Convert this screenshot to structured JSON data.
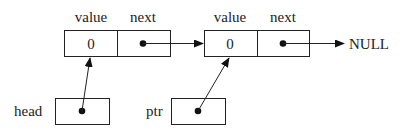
{
  "diagram": {
    "type": "linked-list",
    "header_labels": {
      "value": "value",
      "next": "next"
    },
    "nodes": [
      {
        "value": "0",
        "value_label": "value",
        "next_label": "next"
      },
      {
        "value": "0",
        "value_label": "value",
        "next_label": "next"
      }
    ],
    "terminal": "NULL",
    "pointers": [
      {
        "name": "head",
        "points_to": "node-1"
      },
      {
        "name": "ptr",
        "points_to": "node-2"
      }
    ]
  }
}
